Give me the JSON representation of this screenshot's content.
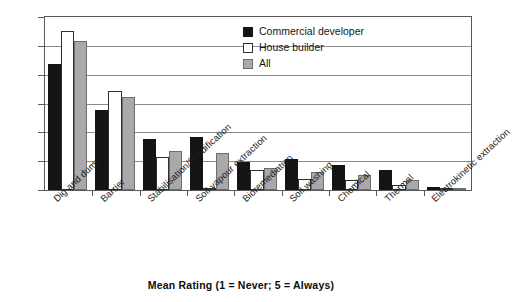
{
  "chart_data": {
    "type": "bar",
    "title": "",
    "xlabel": "Mean Rating (1 = Never; 5 = Always)",
    "ylabel": "",
    "ylim": [
      1,
      4
    ],
    "yticks": [
      1,
      1.5,
      2,
      2.5,
      3,
      3.5,
      4
    ],
    "ytick_labels": [
      "1",
      "1.5",
      "2",
      "2.5",
      "3",
      "3.5",
      "4"
    ],
    "grid": true,
    "legend_position": "top-right",
    "categories": [
      "Dig and dump",
      "Barrier",
      "Stabilisation/Solidification",
      "Soil vapour extraction",
      "Bioremediation",
      "Soil washing",
      "Chemical",
      "Thermal",
      "Electrokinetic extraction"
    ],
    "series": [
      {
        "name": "Commercial developer",
        "color": "#141414",
        "values": [
          3.19,
          2.38,
          1.88,
          1.92,
          1.49,
          1.53,
          1.43,
          1.35,
          1.06
        ]
      },
      {
        "name": "House builder",
        "color": "#ffffff",
        "values": [
          3.76,
          2.71,
          1.58,
          1.0,
          1.34,
          1.19,
          1.18,
          1.09,
          1.02
        ]
      },
      {
        "name": "All",
        "color": "#a9a9ab",
        "values": [
          3.58,
          2.61,
          1.68,
          1.64,
          1.39,
          1.31,
          1.26,
          1.18,
          1.03
        ]
      }
    ]
  },
  "legend": {
    "items": [
      {
        "label": "Commercial developer"
      },
      {
        "label": "House builder"
      },
      {
        "label": "All"
      }
    ]
  },
  "axis_title": "Mean Rating (1 = Never; 5 = Always)"
}
